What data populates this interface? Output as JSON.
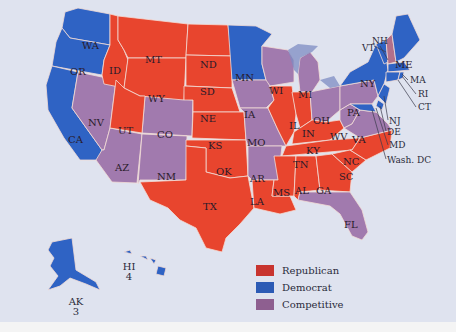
{
  "title_fragment": "",
  "colors": {
    "republican": "#e8452e",
    "democrat": "#2f63c4",
    "competitive": "#a17aae",
    "background": "#dfe3ef",
    "border": "#f3dcd6"
  },
  "legend": [
    {
      "key": "republican",
      "label": "Republican",
      "color": "#c8342f"
    },
    {
      "key": "democrat",
      "label": "Democrat",
      "color": "#2c5bb5"
    },
    {
      "key": "competitive",
      "label": "Competitive",
      "color": "#8e5f90"
    }
  ],
  "states": {
    "republican": [
      "MT",
      "ID",
      "WY",
      "UT",
      "ND",
      "SD",
      "NE",
      "KS",
      "OK",
      "TX",
      "IL",
      "IN",
      "KY",
      "TN",
      "MS",
      "AL",
      "GA",
      "SC",
      "NC",
      "LA"
    ],
    "democrat": [
      "WA",
      "OR",
      "CA",
      "MN",
      "NY",
      "VT",
      "NH",
      "ME",
      "MA",
      "RI",
      "CT",
      "NJ",
      "DE",
      "MD",
      "Wash. DC",
      "HI",
      "AK"
    ],
    "competitive": [
      "NV",
      "AZ",
      "CO",
      "NM",
      "IA",
      "MO",
      "AR",
      "WI",
      "MI",
      "OH",
      "PA",
      "WV",
      "VA",
      "FL"
    ]
  },
  "labels": {
    "WA": "WA",
    "OR": "OR",
    "CA": "CA",
    "ID": "ID",
    "NV": "NV",
    "MT": "MT",
    "WY": "WY",
    "UT": "UT",
    "AZ": "AZ",
    "CO": "CO",
    "NM": "NM",
    "ND": "ND",
    "SD": "SD",
    "NE": "NE",
    "KS": "KS",
    "OK": "OK",
    "TX": "TX",
    "MN": "MN",
    "IA": "IA",
    "MO": "MO",
    "AR": "AR",
    "LA": "LA",
    "WI": "WI",
    "IL": "IL",
    "MI": "MI",
    "IN": "IN",
    "OH": "OH",
    "KY": "KY",
    "TN": "TN",
    "MS": "MS",
    "AL": "AL",
    "GA": "GA",
    "FL": "FL",
    "SC": "SC",
    "NC": "NC",
    "VA": "VA",
    "WV": "WV",
    "PA": "PA",
    "NY": "NY",
    "VT": "VT",
    "NH": "NH",
    "ME": "ME",
    "MA": "MA",
    "RI": "RI",
    "CT": "CT",
    "NJ": "NJ",
    "DE": "DE",
    "MD": "MD",
    "DC": "Wash. DC"
  },
  "alaska": {
    "label": "AK",
    "votes": "3"
  },
  "hawaii": {
    "label": "HI",
    "votes": "4"
  }
}
